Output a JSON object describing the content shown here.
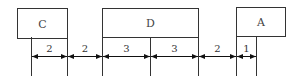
{
  "boxes": [
    {
      "label": "C",
      "x": 17,
      "y": 8,
      "w": 50,
      "h": 30
    },
    {
      "label": "D",
      "x": 102,
      "y": 8,
      "w": 96,
      "h": 29
    },
    {
      "label": "A",
      "x": 236,
      "y": 7,
      "w": 49,
      "h": 29
    }
  ],
  "ticks": [
    31,
    67,
    102,
    150,
    198,
    236,
    256
  ],
  "dimensions": [
    {
      "value": "2",
      "from": 31,
      "to": 67
    },
    {
      "value": "2",
      "from": 67,
      "to": 102
    },
    {
      "value": "3",
      "from": 102,
      "to": 150
    },
    {
      "value": "3",
      "from": 150,
      "to": 198
    },
    {
      "value": "2",
      "from": 198,
      "to": 236
    },
    {
      "value": "1",
      "from": 236,
      "to": 256
    }
  ],
  "colors": {
    "stroke": "#333333",
    "text": "#444444"
  }
}
